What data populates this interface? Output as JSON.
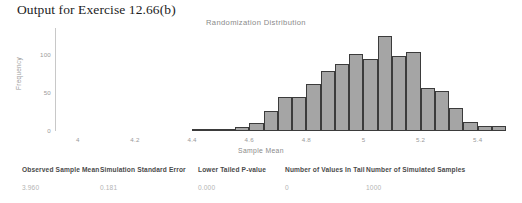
{
  "page": {
    "heading": "Output for Exercise 12.66(b)"
  },
  "chart_data": {
    "type": "bar",
    "title": "Randomization Distribution",
    "xlabel": "Sample Mean",
    "ylabel": "Frequency",
    "grid": false,
    "legend": null,
    "xlim": [
      3.92,
      5.52
    ],
    "ylim": [
      0,
      135
    ],
    "xticks": [
      "4",
      "4.2",
      "4.4",
      "4.6",
      "4.8",
      "5",
      "5.2",
      "5.4"
    ],
    "xtick_values": [
      4,
      4.2,
      4.4,
      4.6,
      4.8,
      5,
      5.2,
      5.4
    ],
    "yticks": [
      "0",
      "50",
      "100"
    ],
    "ytick_values": [
      0,
      50,
      100
    ],
    "bin_width": 0.05,
    "categories": [
      "4.40",
      "4.45",
      "4.50",
      "4.55",
      "4.60",
      "4.65",
      "4.70",
      "4.75",
      "4.80",
      "4.85",
      "4.90",
      "4.95",
      "5.00",
      "5.05",
      "5.10",
      "5.15",
      "5.20",
      "5.25",
      "5.30",
      "5.35",
      "5.40",
      "5.45"
    ],
    "values": [
      1,
      1,
      2,
      5,
      11,
      26,
      45,
      45,
      62,
      79,
      88,
      101,
      95,
      125,
      98,
      103,
      57,
      52,
      30,
      12,
      6,
      7
    ],
    "bar_fill": "#a5a5a5",
    "bar_edge": "#3b3b3b"
  },
  "summary": {
    "headers": [
      "Observed Sample Mean",
      "Simulation Standard Error",
      "Lower Tailed P-value",
      "Number of Values In Tail",
      "Number of Simulated Samples"
    ],
    "values": [
      "3.960",
      "0.181",
      "0.000",
      "0",
      "1000"
    ]
  }
}
